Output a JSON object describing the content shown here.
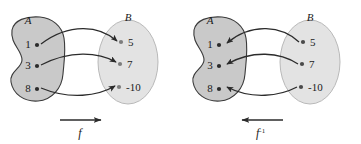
{
  "figure": {
    "background_color": "#ffffff",
    "panels": [
      {
        "id": "panel-forward",
        "map_label": "f",
        "map_superscript": "",
        "direction": "left-to-right",
        "domain": {
          "name": "A",
          "shape": "blob",
          "fill_color": "#c9c9c9",
          "stroke_color": "#3a3a3a",
          "elements": [
            "1",
            "3",
            "8"
          ]
        },
        "codomain": {
          "name": "B",
          "shape": "ellipse",
          "fill_color": "#e3e3e3",
          "stroke_color": "#b9b9b9",
          "elements": [
            "5",
            "7",
            "-10"
          ]
        },
        "mappings": [
          {
            "from": "1",
            "to": "5"
          },
          {
            "from": "3",
            "to": "7"
          },
          {
            "from": "8",
            "to": "-10"
          }
        ]
      },
      {
        "id": "panel-inverse",
        "map_label": "f",
        "map_superscript": "-1",
        "direction": "right-to-left",
        "domain": {
          "name": "A",
          "shape": "blob",
          "fill_color": "#c9c9c9",
          "stroke_color": "#3a3a3a",
          "elements": [
            "1",
            "3",
            "8"
          ]
        },
        "codomain": {
          "name": "B",
          "shape": "ellipse",
          "fill_color": "#e3e3e3",
          "stroke_color": "#b9b9b9",
          "elements": [
            "5",
            "7",
            "-10"
          ]
        },
        "mappings": [
          {
            "from": "5",
            "to": "1"
          },
          {
            "from": "7",
            "to": "3"
          },
          {
            "from": "-10",
            "to": "8"
          }
        ]
      }
    ],
    "colors": {
      "arrow": "#2b2b2b",
      "dot": "#2b2b2b",
      "text": "#1a1a1a"
    }
  }
}
